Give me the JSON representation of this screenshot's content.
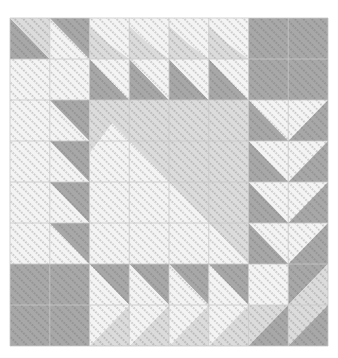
{
  "diagram": {
    "kind": "quilt-block-pattern",
    "grid": {
      "cols": 8,
      "rows": 8
    },
    "colors": {
      "background": "#ffffff",
      "white": "#f4f4f4",
      "light": "#dcdcdc",
      "dark": "#a8a8a8",
      "seam": "#c8c8c8",
      "quilting_stitch": "#5a5a5a"
    },
    "corners": {
      "top_right": "dark",
      "bottom_left": "dark"
    },
    "center": {
      "span": 4,
      "upper_right": "light",
      "lower_left": "white",
      "top_left_corner": "light"
    },
    "top_band": {
      "row0_left": [
        {
          "tri_a": "dark",
          "tri_b": "light",
          "diag": "anti"
        },
        {
          "tri_a": "white",
          "tri_b": "dark",
          "diag": "anti"
        }
      ],
      "row1_left": [
        "white",
        "white"
      ],
      "row0_mid": {
        "count": 4,
        "top": "white",
        "bottom": "light"
      },
      "row1_mid": {
        "count": 4,
        "lower_left": "dark",
        "upper_right": "white"
      }
    },
    "left_band": {
      "count": 4,
      "col0": "white",
      "col1_upper_right": "dark",
      "col1_lower_left": "white"
    },
    "right_band": {
      "count": 4,
      "goose": "white",
      "flanks": "dark",
      "direction": "down"
    },
    "bottom_band": {
      "count": 4,
      "goose": "white",
      "top_flank": "dark",
      "bottom_flank": "light",
      "direction": "right"
    },
    "bottom_right": {
      "cells": [
        {
          "fill": "white"
        },
        {
          "upper_left": "dark",
          "lower_right": "light"
        },
        {
          "upper_left": "light",
          "lower_right": "dark"
        },
        {
          "upper_left": "light",
          "lower_right": "dark"
        }
      ]
    }
  }
}
